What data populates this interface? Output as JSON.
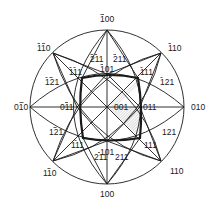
{
  "diagram": {
    "title": "",
    "type": "stereographic projection",
    "labels": {
      "top": "100",
      "bottom": "100",
      "left": "010",
      "right": "010",
      "upper_left_110": "110",
      "upper_right_110": "110",
      "lower_left_110": "110",
      "lower_right_110": "110",
      "upper_left_111": "111",
      "upper_right_111": "111",
      "lower_left_111": "111",
      "lower_right_111": "111",
      "upper_left_121": "121",
      "upper_right_121": "121",
      "lower_left_121": "121",
      "lower_right_121": "121",
      "upper_left_211": "211",
      "upper_right_211": "211",
      "lower_left_211": "211",
      "lower_right_211": "211",
      "upper_101": "101",
      "lower_101": "101",
      "left_011": "011",
      "right_011": "011",
      "center": "001"
    },
    "poles": [
      {
        "id": "top",
        "text": "100",
        "bars": [
          0
        ]
      },
      {
        "id": "bottom",
        "text": "100",
        "bars": []
      },
      {
        "id": "left",
        "text": "010",
        "bars": [
          1
        ]
      },
      {
        "id": "right",
        "text": "010",
        "bars": []
      },
      {
        "id": "upper_left_110",
        "text": "110",
        "bars": [
          0,
          1
        ]
      },
      {
        "id": "upper_right_110",
        "text": "110",
        "bars": [
          0
        ]
      },
      {
        "id": "lower_left_110",
        "text": "110",
        "bars": [
          1
        ]
      },
      {
        "id": "lower_right_110",
        "text": "110",
        "bars": []
      },
      {
        "id": "upper_left_111",
        "text": "111",
        "bars": [
          0,
          1
        ]
      },
      {
        "id": "upper_right_111",
        "text": "111",
        "bars": [
          0
        ]
      },
      {
        "id": "lower_left_111",
        "text": "111",
        "bars": [
          1
        ]
      },
      {
        "id": "lower_right_111",
        "text": "111",
        "bars": []
      },
      {
        "id": "upper_left_121",
        "text": "121",
        "bars": [
          0,
          1
        ]
      },
      {
        "id": "upper_right_121",
        "text": "121",
        "bars": [
          0
        ]
      },
      {
        "id": "lower_left_121",
        "text": "121",
        "bars": [
          1
        ]
      },
      {
        "id": "lower_right_121",
        "text": "121",
        "bars": []
      },
      {
        "id": "upper_left_211",
        "text": "211",
        "bars": [
          0,
          1
        ]
      },
      {
        "id": "upper_right_211",
        "text": "211",
        "bars": [
          0
        ]
      },
      {
        "id": "lower_left_211",
        "text": "211",
        "bars": [
          1
        ]
      },
      {
        "id": "lower_right_211",
        "text": "211",
        "bars": []
      },
      {
        "id": "upper_101",
        "text": "101",
        "bars": [
          0
        ]
      },
      {
        "id": "lower_101",
        "text": "101",
        "bars": []
      },
      {
        "id": "left_011",
        "text": "011",
        "bars": [
          1
        ]
      },
      {
        "id": "right_011",
        "text": "011",
        "bars": []
      },
      {
        "id": "center",
        "text": "001",
        "bars": []
      }
    ],
    "colors": {
      "line": "#1a1a1a",
      "background": "#ffffff",
      "shading": "#bdbdbd"
    }
  }
}
